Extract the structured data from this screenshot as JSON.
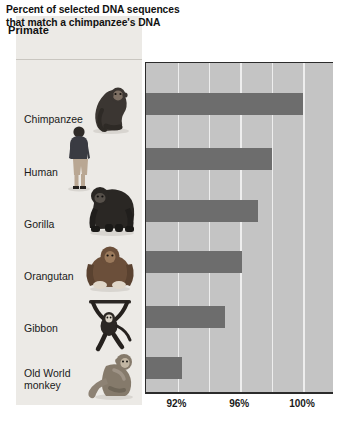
{
  "left_column": {
    "header_label": "Primate"
  },
  "chart_header": {
    "title": "Percent of selected DNA sequences that match a chimpanzee's DNA"
  },
  "axis": {
    "ticks": [
      {
        "label": "92%",
        "value": 92
      },
      {
        "label": "96%",
        "value": 96
      },
      {
        "label": "100%",
        "value": 100
      }
    ]
  },
  "rows": [
    {
      "label": "Chimpanzee",
      "icon": "chimpanzee-illustration",
      "value": 100.0
    },
    {
      "label": "Human",
      "icon": "human-illustration",
      "value": 98.0
    },
    {
      "label": "Gorilla",
      "icon": "gorilla-illustration",
      "value": 97.1
    },
    {
      "label": "Orangutan",
      "icon": "orangutan-illustration",
      "value": 96.1
    },
    {
      "label": "Gibbon",
      "icon": "gibbon-illustration",
      "value": 95.0
    },
    {
      "label": "Old World\nmonkey",
      "icon": "old-world-monkey-illustration",
      "value": 92.3
    }
  ],
  "colors": {
    "bar": "#6d6d6d",
    "panel_background": "#c4c4c4",
    "gridline": "#eeeeee",
    "left_column_background": "#eceae6",
    "frame": "#2b2b2b"
  },
  "chart_data": {
    "type": "bar",
    "orientation": "horizontal",
    "title": "Percent of selected DNA sequences that match a chimpanzee's DNA",
    "xlabel": "",
    "ylabel": "Primate",
    "categories": [
      "Chimpanzee",
      "Human",
      "Gorilla",
      "Orangutan",
      "Gibbon",
      "Old World monkey"
    ],
    "values": [
      100.0,
      98.0,
      97.1,
      96.1,
      95.0,
      92.3
    ],
    "xlim": [
      90,
      102
    ],
    "xticks": [
      92,
      96,
      100
    ],
    "xtick_labels": [
      "92%",
      "96%",
      "100%"
    ],
    "gridlines_at": [
      92,
      94,
      96,
      98,
      100
    ],
    "grid": true,
    "legend": "none",
    "units": "percent"
  }
}
